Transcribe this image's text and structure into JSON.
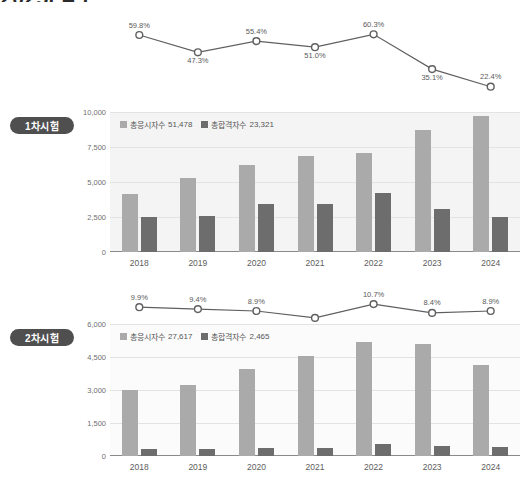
{
  "page": {
    "title_cropped": "2025( 4 )"
  },
  "sections": [
    {
      "badge": "1차시험",
      "legend": [
        {
          "icon": "square-swatch-light",
          "label": "총응시자수",
          "value": "51,478"
        },
        {
          "icon": "square-swatch-dark",
          "label": "총합격자수",
          "value": "23,321"
        }
      ]
    },
    {
      "badge": "2차시험",
      "legend": [
        {
          "icon": "square-swatch-light",
          "label": "총응시자수",
          "value": "27,617"
        },
        {
          "icon": "square-swatch-dark",
          "label": "총합격자수",
          "value": "2,465"
        }
      ]
    }
  ],
  "colors": {
    "series_applicants": "#aaaaaa",
    "series_passers": "#6d6d6d",
    "line": "#5f5f5f",
    "badge_bg": "#4f4f4f",
    "plot_bg_1": "#f4f4f4",
    "plot_bg_2": "#fbfbfb",
    "grid": "#e3e3e3"
  },
  "chart_data": [
    {
      "type": "line",
      "title": "1차시험 합격률",
      "xlabel": "",
      "ylabel": "",
      "grid": false,
      "legend": "none",
      "categories": [
        "2018",
        "2019",
        "2020",
        "2021",
        "2022",
        "2023",
        "2024"
      ],
      "series": [
        {
          "name": "합격률",
          "values": [
            59.8,
            47.3,
            55.4,
            51.0,
            60.3,
            35.1,
            22.4
          ],
          "labels": [
            "59.8%",
            "47.3%",
            "55.4%",
            "51.0%",
            "60.3%",
            "35.1%",
            "22.4%"
          ],
          "label_position": [
            "above",
            "below",
            "above",
            "below",
            "above",
            "below",
            "above"
          ]
        }
      ],
      "ylim": [
        20.0,
        62.0
      ]
    },
    {
      "type": "bar",
      "title": "1차시험 응시자·합격자",
      "xlabel": "",
      "ylabel": "",
      "grid": true,
      "legend": "top-left",
      "categories": [
        "2018",
        "2019",
        "2020",
        "2021",
        "2022",
        "2023",
        "2024"
      ],
      "yticks": [
        "0",
        "2,500",
        "5,000",
        "7,500",
        "10,000"
      ],
      "ylim": [
        0,
        10000
      ],
      "series": [
        {
          "name": "총응시자수",
          "total": "51,478",
          "values": [
            4150,
            5300,
            6250,
            6850,
            7100,
            8700,
            9700
          ]
        },
        {
          "name": "총합격자수",
          "total": "23,321",
          "values": [
            2500,
            2570,
            3450,
            3450,
            4250,
            3050,
            2480
          ]
        }
      ]
    },
    {
      "type": "line",
      "title": "2차시험 합격률",
      "xlabel": "",
      "ylabel": "",
      "grid": false,
      "legend": "none",
      "categories": [
        "2018",
        "2019",
        "2020",
        "2021",
        "2022",
        "2023",
        "2024"
      ],
      "series": [
        {
          "name": "합격률",
          "values": [
            9.9,
            9.4,
            8.9,
            7.1,
            10.7,
            8.4,
            8.9
          ],
          "labels": [
            "9.9%",
            "9.4%",
            "8.9%",
            "7.1%",
            "10.7%",
            "8.4%",
            "8.9%"
          ],
          "label_position": [
            "above",
            "above",
            "above",
            "below",
            "above",
            "above",
            "above"
          ]
        }
      ],
      "ylim": [
        6.8,
        11.0
      ]
    },
    {
      "type": "bar",
      "title": "2차시험 응시자·합격자",
      "xlabel": "",
      "ylabel": "",
      "grid": true,
      "legend": "top-left",
      "categories": [
        "2018",
        "2019",
        "2020",
        "2021",
        "2022",
        "2023",
        "2024"
      ],
      "yticks": [
        "0",
        "1,500",
        "3,000",
        "4,500",
        "6,000"
      ],
      "ylim": [
        0,
        6000
      ],
      "series": [
        {
          "name": "총응시자수",
          "total": "27,617",
          "values": [
            3010,
            3230,
            3950,
            4530,
            5200,
            5080,
            4150
          ]
        },
        {
          "name": "총합격자수",
          "total": "2,465",
          "values": [
            300,
            310,
            370,
            360,
            560,
            440,
            390
          ]
        }
      ]
    }
  ]
}
